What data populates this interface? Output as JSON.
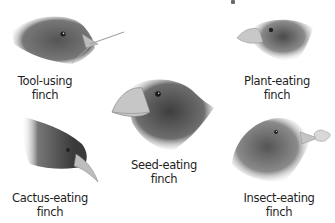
{
  "figure": {
    "title_fragment_visible": true,
    "colors": {
      "background": "#ffffff",
      "label_text": "#1e1e1e",
      "feather_dark": "#3c3c3c",
      "feather_mid": "#7a7a7a",
      "beak": "#c8c8c8"
    },
    "finches": [
      {
        "id": "tool-using",
        "label_line1": "Tool-using",
        "label_line2": "finch",
        "beak": "pointed, holding twig"
      },
      {
        "id": "plant-eating",
        "label_line1": "Plant-eating",
        "label_line2": "finch",
        "beak": "short, thick"
      },
      {
        "id": "seed-eating",
        "label_line1": "Seed-eating",
        "label_line2": "finch",
        "beak": "large, crushing"
      },
      {
        "id": "cactus-eating",
        "label_line1": "Cactus-eating",
        "label_line2": "finch",
        "beak": "long, pointed"
      },
      {
        "id": "insect-eating",
        "label_line1": "Insect-eating",
        "label_line2": "finch",
        "beak": "holding insect"
      }
    ]
  }
}
